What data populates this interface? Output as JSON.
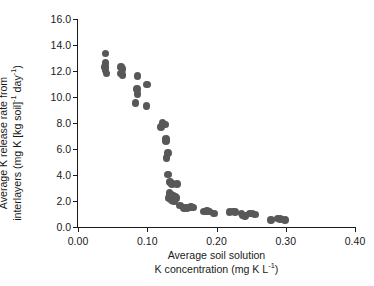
{
  "chart_data": {
    "type": "scatter",
    "title": "",
    "xlabel_line1": "Average soil solution",
    "xlabel_line2_pre": "K concentration (mg K L",
    "xlabel_line2_sup": "-1",
    "xlabel_line2_post": ")",
    "xlabel": "Average soil solution K concentration (mg K L-1)",
    "ylabel_line1": "Average K release rate from",
    "ylabel_line2_pre": "interlayers (mg K [kg soil]",
    "ylabel_line2_sup1": "-1",
    "ylabel_line2_mid": " day",
    "ylabel_line2_sup2": "-1",
    "ylabel_line2_post": ")",
    "ylabel": "Average K release rate from interlayers (mg K [kg soil]-1 day-1)",
    "xlim": [
      0.0,
      0.4
    ],
    "ylim": [
      0.0,
      16.0
    ],
    "xticks": [
      0.0,
      0.1,
      0.2,
      0.3,
      0.4
    ],
    "xtick_labels": [
      "0.00",
      "0.10",
      "0.20",
      "0.30",
      "0.40"
    ],
    "yticks": [
      0.0,
      2.0,
      4.0,
      6.0,
      8.0,
      10.0,
      12.0,
      14.0,
      16.0
    ],
    "ytick_labels": [
      "0.0",
      "2.0",
      "4.0",
      "6.0",
      "8.0",
      "10.0",
      "12.0",
      "14.0",
      "16.0"
    ],
    "grid": false,
    "legend": false,
    "marker_color": "#58585a",
    "marker_size": 7.6,
    "axis_color": "#1a1a1a",
    "series": [
      {
        "name": "K release vs solution K",
        "points": [
          [
            0.04,
            13.35
          ],
          [
            0.04,
            12.6
          ],
          [
            0.039,
            12.3
          ],
          [
            0.04,
            12.05
          ],
          [
            0.041,
            11.8
          ],
          [
            0.062,
            12.3
          ],
          [
            0.064,
            12.15
          ],
          [
            0.062,
            11.8
          ],
          [
            0.064,
            11.7
          ],
          [
            0.086,
            11.6
          ],
          [
            0.085,
            10.6
          ],
          [
            0.086,
            10.25
          ],
          [
            0.083,
            9.55
          ],
          [
            0.1,
            10.95
          ],
          [
            0.099,
            9.3
          ],
          [
            0.122,
            8.05
          ],
          [
            0.126,
            7.9
          ],
          [
            0.12,
            7.7
          ],
          [
            0.127,
            6.75
          ],
          [
            0.127,
            6.6
          ],
          [
            0.13,
            5.7
          ],
          [
            0.128,
            5.3
          ],
          [
            0.13,
            4.05
          ],
          [
            0.133,
            3.45
          ],
          [
            0.136,
            3.3
          ],
          [
            0.143,
            3.3
          ],
          [
            0.132,
            2.6
          ],
          [
            0.135,
            2.45
          ],
          [
            0.138,
            2.4
          ],
          [
            0.14,
            2.35
          ],
          [
            0.131,
            2.25
          ],
          [
            0.134,
            2.2
          ],
          [
            0.137,
            2.2
          ],
          [
            0.142,
            2.25
          ],
          [
            0.136,
            2.05
          ],
          [
            0.139,
            1.95
          ],
          [
            0.147,
            1.65
          ],
          [
            0.153,
            1.45
          ],
          [
            0.157,
            1.45
          ],
          [
            0.163,
            1.55
          ],
          [
            0.166,
            1.5
          ],
          [
            0.182,
            1.2
          ],
          [
            0.186,
            1.25
          ],
          [
            0.19,
            1.2
          ],
          [
            0.196,
            1.05
          ],
          [
            0.219,
            1.15
          ],
          [
            0.223,
            1.2
          ],
          [
            0.227,
            1.15
          ],
          [
            0.236,
            1.05
          ],
          [
            0.238,
            0.9
          ],
          [
            0.241,
            0.85
          ],
          [
            0.248,
            1.05
          ],
          [
            0.252,
            1.05
          ],
          [
            0.256,
            0.95
          ],
          [
            0.279,
            0.55
          ],
          [
            0.288,
            0.65
          ],
          [
            0.292,
            0.6
          ],
          [
            0.299,
            0.55
          ]
        ]
      }
    ]
  }
}
